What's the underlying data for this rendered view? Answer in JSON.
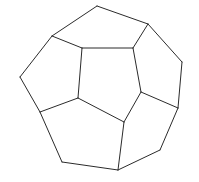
{
  "figure": {
    "style": "hand-drawn black line art on white background",
    "background_color": "#ffffff",
    "line_color": "#2b2b2b",
    "line_width": 1,
    "shape_name": "regular dodecahedron",
    "projection": "oblique perspective view",
    "visible_face_count": 6,
    "vertices": {
      "top_apex": [
        97,
        6
      ],
      "upper_left_outer": [
        52,
        36
      ],
      "upper_right_outer": [
        148,
        24
      ],
      "left_outer_upper": [
        20,
        77
      ],
      "right_outer_upper": [
        182,
        62
      ],
      "left_junction": [
        40,
        112
      ],
      "right_junction": [
        178,
        108
      ],
      "center_top_left": [
        82,
        48
      ],
      "center_top_right": [
        133,
        48
      ],
      "center_left": [
        78,
        98
      ],
      "center_right": [
        124,
        122
      ],
      "bottom_left_corner": [
        62,
        162
      ],
      "bottom_junction": [
        118,
        170
      ],
      "bottom_right_corner": [
        160,
        150
      ]
    },
    "faces": [
      {
        "name": "center-pentagon",
        "points": "82,48 133,48 141,92 124,122 78,98"
      },
      {
        "name": "top-pentagon",
        "points": "52,36 97,6 148,24 133,48 82,48"
      },
      {
        "name": "upper-left-pentagon",
        "points": "52,36 82,48 78,98 40,112 20,77"
      },
      {
        "name": "upper-right-pentagon",
        "points": "148,24 182,62 178,108 141,92 133,48"
      },
      {
        "name": "lower-left-pentagon",
        "points": "40,112 78,98 124,122 118,170 62,162"
      },
      {
        "name": "lower-right-pentagon",
        "points": "124,122 141,92 178,108 160,150 118,170"
      }
    ],
    "edges": [
      {
        "name": "edge-top-apex-to-upper-left",
        "path": "M 97,6 L 52,36"
      },
      {
        "name": "edge-top-apex-to-upper-right",
        "path": "M 97,6 L 148,24"
      },
      {
        "name": "edge-upper-left-to-center-top-left",
        "path": "M 52,36 L 82,48"
      },
      {
        "name": "edge-center-top-left-to-center-top-right",
        "path": "M 82,48 L 133,48"
      },
      {
        "name": "edge-upper-right-to-center-top-right",
        "path": "M 148,24 L 133,48"
      },
      {
        "name": "edge-upper-left-to-left-outer",
        "path": "M 52,36 L 20,77"
      },
      {
        "name": "edge-left-outer-to-left-junction",
        "path": "M 20,77 L 40,112"
      },
      {
        "name": "edge-center-top-left-to-center-left",
        "path": "M 82,48 L 78,98"
      },
      {
        "name": "edge-left-junction-to-center-left",
        "path": "M 40,112 L 78,98"
      },
      {
        "name": "edge-upper-right-to-right-outer",
        "path": "M 148,24 L 182,62"
      },
      {
        "name": "edge-right-outer-to-right-junction",
        "path": "M 182,62 L 178,108"
      },
      {
        "name": "edge-center-top-right-to-center-mid-right",
        "path": "M 133,48 L 141,92"
      },
      {
        "name": "edge-center-mid-right-to-right-junction",
        "path": "M 141,92 L 178,108"
      },
      {
        "name": "edge-center-left-to-center-right",
        "path": "M 78,98 L 124,122"
      },
      {
        "name": "edge-center-mid-right-to-center-right",
        "path": "M 141,92 L 124,122"
      },
      {
        "name": "edge-left-junction-to-bottom-left",
        "path": "M 40,112 L 62,162"
      },
      {
        "name": "edge-bottom-left-to-bottom-junction",
        "path": "M 62,162 L 118,170"
      },
      {
        "name": "edge-center-right-to-bottom-junction",
        "path": "M 124,122 L 118,170"
      },
      {
        "name": "edge-bottom-junction-to-bottom-right",
        "path": "M 118,170 L 160,150"
      },
      {
        "name": "edge-right-junction-to-bottom-right",
        "path": "M 178,108 L 160,150"
      }
    ]
  }
}
